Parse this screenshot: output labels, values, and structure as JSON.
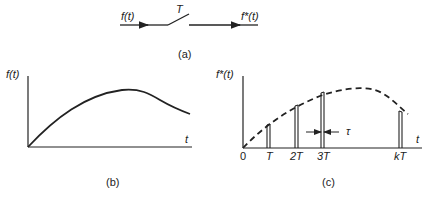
{
  "panel_a": {
    "caption": "(a)",
    "input_label": "f(t)",
    "switch_label": "T",
    "output_label": "f*(t)"
  },
  "panel_b": {
    "caption": "(b)",
    "y_label": "f(t)",
    "x_label": "t"
  },
  "panel_c": {
    "caption": "(c)",
    "y_label": "f*(t)",
    "x_label": "t",
    "origin_label": "0",
    "tick_labels": [
      "T",
      "2T",
      "3T",
      "kT"
    ],
    "pulse_width_label": "τ"
  },
  "colors": {
    "ink": "#222222",
    "background": "#ffffff"
  }
}
